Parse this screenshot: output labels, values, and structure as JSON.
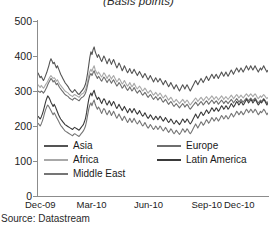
{
  "chart_data": {
    "type": "line",
    "title": "(Basis points)",
    "xlabel": "",
    "ylabel": "",
    "ylim": [
      0,
      500
    ],
    "yticks": [
      0,
      100,
      200,
      300,
      400,
      500
    ],
    "grid": false,
    "legend_position": "lower-left",
    "source": "Source: Datastream",
    "xtick_labels": [
      "Dec-09",
      "Mar-10",
      "Jun-10",
      "Sep-10",
      "Dec-10"
    ],
    "xtick_positions": [
      0,
      0.25,
      0.5,
      0.75,
      1.0
    ],
    "series": [
      {
        "name": "Asia",
        "color": "#545454",
        "values": [
          352,
          345,
          338,
          342,
          336,
          330,
          336,
          344,
          352,
          362,
          372,
          384,
          392,
          386,
          378,
          382,
          374,
          366,
          372,
          364,
          356,
          348,
          342,
          336,
          330,
          324,
          320,
          316,
          312,
          306,
          302,
          298,
          296,
          300,
          304,
          300,
          296,
          292,
          290,
          294,
          298,
          302,
          306,
          312,
          320,
          334,
          352,
          374,
          396,
          412,
          404,
          418,
          426,
          412,
          404,
          396,
          404,
          398,
          390,
          384,
          392,
          400,
          394,
          386,
          378,
          386,
          392,
          384,
          376,
          384,
          390,
          382,
          374,
          366,
          372,
          380,
          374,
          366,
          358,
          364,
          372,
          366,
          358,
          352,
          358,
          364,
          356,
          350,
          356,
          362,
          356,
          350,
          344,
          350,
          356,
          350,
          344,
          338,
          344,
          350,
          344,
          338,
          332,
          338,
          344,
          338,
          332,
          326,
          332,
          338,
          332,
          326,
          330,
          336,
          330,
          324,
          318,
          324,
          330,
          324,
          318,
          312,
          318,
          324,
          318,
          312,
          306,
          312,
          318,
          312,
          306,
          300,
          306,
          312,
          318,
          312,
          306,
          312,
          318,
          312,
          306,
          300,
          306,
          312,
          318,
          324,
          330,
          324,
          318,
          324,
          330,
          336,
          330,
          324,
          330,
          336,
          342,
          336,
          330,
          336,
          342,
          348,
          342,
          336,
          342,
          348,
          342,
          336,
          342,
          348,
          354,
          348,
          342,
          348,
          354,
          348,
          342,
          348,
          354,
          360,
          354,
          348,
          354,
          360,
          366,
          360,
          354,
          360,
          366,
          360,
          354,
          360,
          366,
          372,
          366,
          360,
          366,
          372,
          366,
          360,
          366,
          372,
          366,
          360,
          354,
          360,
          366,
          360,
          366,
          372,
          366,
          360,
          354,
          360
        ]
      },
      {
        "name": "Africa",
        "color": "#a8a8a8",
        "values": [
          318,
          314,
          310,
          316,
          312,
          308,
          312,
          318,
          322,
          328,
          334,
          340,
          344,
          340,
          336,
          338,
          334,
          328,
          332,
          326,
          320,
          316,
          312,
          308,
          304,
          300,
          298,
          296,
          294,
          290,
          288,
          286,
          284,
          288,
          290,
          288,
          286,
          284,
          282,
          286,
          290,
          292,
          294,
          298,
          304,
          314,
          328,
          344,
          356,
          362,
          356,
          366,
          372,
          360,
          354,
          348,
          354,
          350,
          344,
          340,
          346,
          352,
          348,
          342,
          336,
          342,
          346,
          340,
          334,
          340,
          344,
          338,
          332,
          326,
          330,
          336,
          332,
          326,
          320,
          324,
          330,
          324,
          318,
          314,
          318,
          324,
          318,
          312,
          316,
          322,
          316,
          310,
          306,
          310,
          314,
          310,
          304,
          300,
          304,
          308,
          304,
          298,
          294,
          298,
          302,
          298,
          292,
          288,
          292,
          296,
          292,
          286,
          290,
          294,
          290,
          284,
          280,
          284,
          288,
          284,
          278,
          274,
          278,
          282,
          278,
          272,
          268,
          272,
          276,
          272,
          268,
          264,
          268,
          272,
          276,
          272,
          266,
          270,
          274,
          270,
          264,
          260,
          264,
          268,
          272,
          276,
          280,
          276,
          270,
          274,
          278,
          282,
          278,
          272,
          276,
          280,
          284,
          280,
          274,
          278,
          282,
          286,
          282,
          276,
          280,
          284,
          280,
          274,
          278,
          282,
          286,
          282,
          276,
          280,
          284,
          280,
          276,
          280,
          284,
          288,
          284,
          278,
          282,
          286,
          290,
          286,
          280,
          284,
          288,
          284,
          280,
          284,
          288,
          292,
          288,
          284,
          288,
          292,
          288,
          284,
          288,
          292,
          288,
          282,
          278,
          282,
          286,
          282,
          286,
          290,
          286,
          282,
          278,
          282
        ]
      },
      {
        "name": "Europe",
        "color": "#6e6e6e",
        "values": [
          300,
          298,
          296,
          300,
          298,
          294,
          298,
          304,
          310,
          318,
          324,
          330,
          336,
          332,
          326,
          330,
          324,
          318,
          322,
          316,
          310,
          306,
          302,
          298,
          294,
          290,
          288,
          286,
          284,
          280,
          278,
          276,
          274,
          278,
          280,
          278,
          276,
          274,
          272,
          276,
          280,
          282,
          284,
          288,
          294,
          304,
          318,
          332,
          344,
          350,
          344,
          352,
          358,
          348,
          342,
          336,
          342,
          338,
          332,
          328,
          334,
          340,
          336,
          330,
          324,
          330,
          334,
          328,
          322,
          328,
          332,
          326,
          320,
          314,
          318,
          324,
          320,
          314,
          308,
          312,
          318,
          312,
          306,
          302,
          306,
          312,
          306,
          300,
          304,
          310,
          304,
          298,
          294,
          298,
          302,
          298,
          292,
          288,
          292,
          296,
          292,
          286,
          282,
          286,
          290,
          286,
          280,
          276,
          280,
          284,
          280,
          274,
          278,
          282,
          278,
          272,
          268,
          272,
          276,
          272,
          266,
          262,
          266,
          270,
          266,
          260,
          256,
          260,
          264,
          260,
          256,
          252,
          256,
          260,
          264,
          260,
          254,
          258,
          262,
          258,
          252,
          248,
          252,
          256,
          260,
          264,
          268,
          264,
          258,
          262,
          266,
          270,
          266,
          260,
          264,
          268,
          272,
          268,
          262,
          266,
          270,
          274,
          270,
          264,
          268,
          272,
          268,
          262,
          266,
          270,
          274,
          270,
          264,
          268,
          272,
          268,
          264,
          268,
          272,
          276,
          272,
          266,
          270,
          274,
          278,
          274,
          268,
          272,
          276,
          272,
          268,
          272,
          276,
          280,
          276,
          272,
          276,
          280,
          276,
          272,
          276,
          280,
          276,
          270,
          266,
          270,
          274,
          270,
          274,
          278,
          274,
          270,
          266,
          270
        ]
      },
      {
        "name": "Latin America",
        "color": "#3a3a3a",
        "values": [
          228,
          224,
          220,
          226,
          234,
          244,
          256,
          268,
          278,
          286,
          282,
          276,
          268,
          262,
          256,
          262,
          256,
          248,
          240,
          232,
          226,
          220,
          216,
          212,
          208,
          204,
          202,
          200,
          198,
          196,
          194,
          192,
          190,
          194,
          196,
          194,
          192,
          190,
          188,
          192,
          196,
          200,
          204,
          212,
          222,
          238,
          258,
          276,
          288,
          294,
          286,
          296,
          302,
          290,
          282,
          276,
          282,
          278,
          270,
          264,
          272,
          278,
          274,
          266,
          260,
          266,
          272,
          266,
          258,
          264,
          270,
          264,
          256,
          250,
          256,
          262,
          256,
          250,
          244,
          250,
          256,
          250,
          244,
          238,
          244,
          250,
          244,
          238,
          244,
          250,
          244,
          238,
          234,
          238,
          244,
          238,
          232,
          228,
          232,
          238,
          232,
          226,
          222,
          226,
          232,
          228,
          222,
          218,
          222,
          228,
          224,
          218,
          222,
          228,
          224,
          218,
          214,
          218,
          224,
          220,
          214,
          210,
          214,
          220,
          216,
          210,
          206,
          210,
          216,
          212,
          208,
          204,
          208,
          214,
          220,
          216,
          210,
          214,
          220,
          216,
          210,
          206,
          210,
          216,
          222,
          228,
          234,
          228,
          222,
          228,
          234,
          240,
          236,
          230,
          234,
          240,
          246,
          242,
          236,
          240,
          246,
          252,
          248,
          242,
          246,
          252,
          248,
          242,
          246,
          252,
          258,
          254,
          248,
          252,
          258,
          254,
          248,
          252,
          258,
          264,
          260,
          254,
          258,
          264,
          270,
          266,
          260,
          264,
          270,
          266,
          260,
          264,
          270,
          276,
          272,
          266,
          270,
          276,
          272,
          266,
          270,
          276,
          272,
          266,
          260,
          264,
          270,
          266,
          270,
          276,
          272,
          266,
          260,
          266
        ]
      },
      {
        "name": "Middle East",
        "color": "#757575",
        "values": [
          208,
          204,
          200,
          206,
          214,
          224,
          236,
          246,
          254,
          260,
          256,
          250,
          244,
          238,
          232,
          238,
          232,
          226,
          220,
          214,
          208,
          202,
          198,
          194,
          190,
          186,
          184,
          182,
          180,
          178,
          176,
          174,
          172,
          176,
          178,
          176,
          174,
          172,
          170,
          174,
          178,
          182,
          186,
          192,
          200,
          214,
          232,
          248,
          260,
          266,
          258,
          268,
          274,
          262,
          254,
          248,
          254,
          250,
          242,
          236,
          244,
          250,
          246,
          238,
          232,
          238,
          244,
          238,
          230,
          236,
          242,
          236,
          228,
          222,
          228,
          234,
          228,
          222,
          216,
          222,
          228,
          222,
          216,
          210,
          216,
          222,
          216,
          210,
          216,
          222,
          216,
          210,
          206,
          210,
          216,
          210,
          204,
          200,
          204,
          210,
          204,
          198,
          194,
          198,
          204,
          200,
          194,
          190,
          194,
          200,
          196,
          190,
          194,
          200,
          196,
          190,
          186,
          190,
          196,
          192,
          186,
          182,
          186,
          192,
          188,
          182,
          178,
          182,
          188,
          184,
          180,
          176,
          180,
          186,
          192,
          188,
          182,
          186,
          192,
          188,
          182,
          178,
          182,
          188,
          194,
          200,
          206,
          200,
          194,
          200,
          206,
          212,
          208,
          202,
          206,
          212,
          218,
          214,
          208,
          212,
          218,
          224,
          220,
          214,
          218,
          224,
          220,
          214,
          218,
          224,
          230,
          226,
          220,
          224,
          230,
          226,
          220,
          224,
          230,
          236,
          232,
          226,
          230,
          236,
          242,
          238,
          232,
          236,
          242,
          238,
          232,
          236,
          242,
          248,
          244,
          238,
          242,
          248,
          244,
          238,
          242,
          248,
          244,
          238,
          232,
          236,
          242,
          238,
          242,
          248,
          244,
          238,
          232,
          238
        ]
      }
    ]
  },
  "legend": {
    "rows": [
      [
        {
          "name": "Asia"
        },
        {
          "name": "Europe"
        }
      ],
      [
        {
          "name": "Africa"
        },
        {
          "name": "Latin America"
        }
      ],
      [
        {
          "name": "Middle East"
        }
      ]
    ]
  }
}
